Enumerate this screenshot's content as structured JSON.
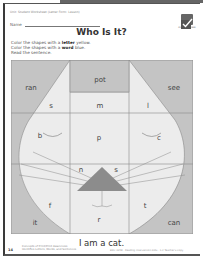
{
  "header": {
    "unit_line": "Unit: Student Worksheet (Letter Form: Lesson)",
    "name_label": "Name",
    "title": "Who Is It?",
    "badge_label": "Activity Sheet"
  },
  "instructions": {
    "line1_pre": "Color the shapes with a ",
    "line1_bold": "letter",
    "line1_post": " yellow.",
    "line2_pre": "Color the shapes with a ",
    "line2_bold": "word",
    "line2_post": " blue.",
    "line3": "Read the sentence."
  },
  "puzzle": {
    "word_cells": [
      "ran",
      "pot",
      "see",
      "it",
      "can"
    ],
    "letter_cells": [
      "s",
      "m",
      "l",
      "b",
      "p",
      "c",
      "n",
      "s",
      "f",
      "t",
      "r"
    ],
    "colors": {
      "word_fill": "#c4c4c4",
      "letter_fill": "#ececec",
      "nose": "#8c8c8c",
      "lines": "#8a8a8a"
    }
  },
  "sentence": "I am a cat.",
  "footer": {
    "page_number": "14",
    "concept_line1": "Concepts of Print/Print Awareness",
    "concept_line2": "Identifies Letters, Words, and Sentences",
    "publisher_line": "EMC 3358 · Reading Intervention Kids · 1-2 Teacher's Copy"
  }
}
